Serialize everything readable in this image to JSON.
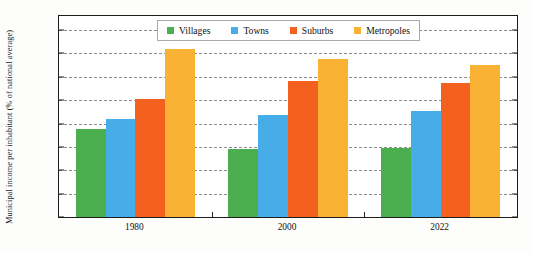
{
  "chart_data": {
    "type": "bar",
    "title": "",
    "subtitle": "",
    "xlabel": "",
    "ylabel": "Municipal income per inhabitant (% of national average)",
    "categories": [
      "1980",
      "2000",
      "2022"
    ],
    "series": [
      {
        "name": "Villages",
        "color": "#4CAF4F",
        "values": [
          75,
          58,
          59
        ]
      },
      {
        "name": "Towns",
        "color": "#47ADE8",
        "values": [
          84,
          87,
          91
        ]
      },
      {
        "name": "Suburbs",
        "color": "#F4601E",
        "values": [
          101,
          116,
          115
        ]
      },
      {
        "name": "Metropoles",
        "color": "#F9B233",
        "values": [
          144,
          135,
          130
        ]
      }
    ],
    "ylim": [
      0,
      172
    ],
    "yticks": [
      0,
      20,
      40,
      60,
      80,
      100,
      120,
      140,
      160
    ],
    "ytick_labels": [
      "0%",
      "20%",
      "40%",
      "60%",
      "80%",
      "100%",
      "120%",
      "140%",
      "160%"
    ],
    "grid": true,
    "grid_style": "dashed",
    "legend_position": "top-center",
    "legend_entries": [
      "Villages",
      "Towns",
      "Suburbs",
      "Metropoles"
    ],
    "bar_group_gap_pct": 22
  }
}
